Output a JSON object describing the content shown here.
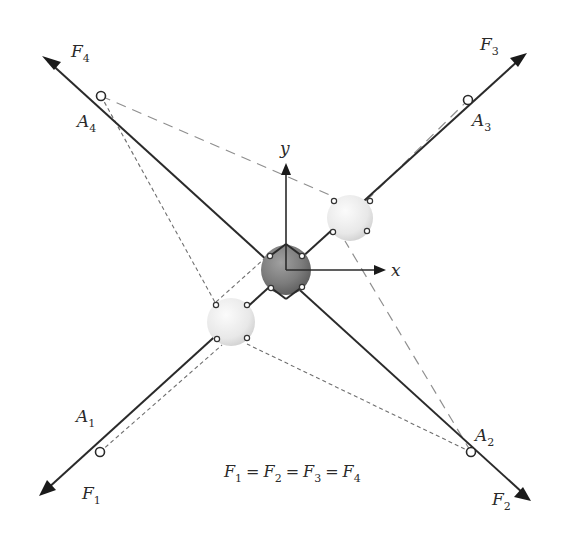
{
  "diagram": {
    "forces": [
      {
        "label": "F",
        "subscript": "1"
      },
      {
        "label": "F",
        "subscript": "2"
      },
      {
        "label": "F",
        "subscript": "3"
      },
      {
        "label": "F",
        "subscript": "4"
      }
    ],
    "anchors": [
      {
        "label": "A",
        "subscript": "1"
      },
      {
        "label": "A",
        "subscript": "2"
      },
      {
        "label": "A",
        "subscript": "3"
      },
      {
        "label": "A",
        "subscript": "4"
      }
    ],
    "axes": {
      "x_label": "x",
      "y_label": "y"
    },
    "equation": {
      "terms": [
        {
          "label": "F",
          "subscript": "1"
        },
        {
          "label": "F",
          "subscript": "2"
        },
        {
          "label": "F",
          "subscript": "3"
        },
        {
          "label": "F",
          "subscript": "4"
        }
      ],
      "operator": "="
    },
    "colors": {
      "line": "#2a2a2a",
      "dashed": "#8a8a8a",
      "dark_sphere": "#7a7a7a",
      "light_sphere": "#e6e6e6"
    }
  }
}
